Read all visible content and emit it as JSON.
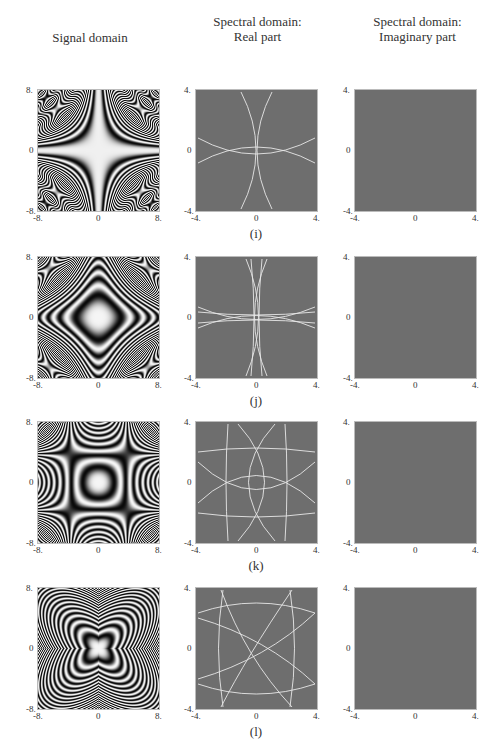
{
  "column_headers": {
    "signal": [
      "Signal domain"
    ],
    "real": [
      "Spectral domain:",
      "Real part"
    ],
    "imag": [
      "Spectral domain:",
      "Imaginary part"
    ]
  },
  "rows": [
    {
      "caption": "(i)",
      "pattern": "cross-fringe"
    },
    {
      "caption": "(j)",
      "pattern": "ellipse-cross"
    },
    {
      "caption": "(k)",
      "pattern": "hyperbolic-bands"
    },
    {
      "caption": "(l)",
      "pattern": "diagonal-x"
    }
  ],
  "axes": {
    "signal": {
      "min": "-8.",
      "mid": "0",
      "max": "8."
    },
    "spectral": {
      "min": "-4.",
      "mid": "0",
      "max": "4."
    }
  },
  "colors": {
    "spectral_bg": "#6e6e6e",
    "curve": "#e8e8e8",
    "frame": "#bbbbbb"
  }
}
